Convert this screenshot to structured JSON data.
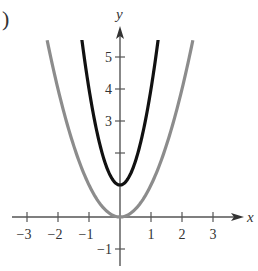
{
  "part_label": ")",
  "chart_data": {
    "type": "line",
    "title": "",
    "xlabel": "x",
    "ylabel": "y",
    "xlim": [
      -3.3,
      3.9
    ],
    "ylim": [
      -1.5,
      5.8
    ],
    "grid": false,
    "legend": null,
    "x_ticks": [
      -3,
      -2,
      -1,
      1,
      2,
      3
    ],
    "x_tick_labels": [
      "−3",
      "−2",
      "−1",
      "1",
      "2",
      "3"
    ],
    "y_ticks": [
      -1,
      2,
      3,
      4,
      5
    ],
    "y_tick_labels": [
      "−1",
      "",
      "3",
      "4",
      "5"
    ],
    "series": [
      {
        "name": "gray parabola",
        "equation": "y = x^2",
        "color": "#8c8c8c",
        "x": [
          -2.35,
          -2,
          -1.5,
          -1,
          -0.5,
          0,
          0.5,
          1,
          1.5,
          2,
          2.35
        ],
        "y": [
          5.52,
          4,
          2.25,
          1,
          0.25,
          0,
          0.25,
          1,
          2.25,
          4,
          5.52
        ]
      },
      {
        "name": "black parabola",
        "equation": "y = 3x^2 + 1",
        "color": "#111111",
        "x": [
          -1.25,
          -1,
          -0.75,
          -0.5,
          -0.25,
          0,
          0.25,
          0.5,
          0.75,
          1,
          1.25
        ],
        "y": [
          5.69,
          4,
          2.69,
          1.75,
          1.19,
          1,
          1.19,
          1.75,
          2.69,
          4,
          5.69
        ]
      }
    ]
  }
}
